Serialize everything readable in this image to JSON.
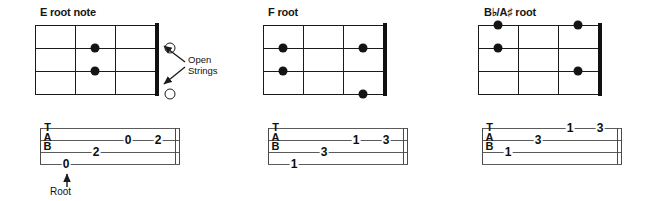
{
  "figure": {
    "kind": "guitar-chord-and-tab-figure",
    "panel_count": 3
  },
  "annotations": {
    "open_strings_label_line1": "Open",
    "open_strings_label_line2": "Strings",
    "root_label": "Root"
  },
  "tab_clef_letters": {
    "t": "T",
    "a": "A",
    "b": "B"
  },
  "panels": [
    {
      "title": "E root note",
      "diagram": {
        "strings": 4,
        "frets": 3,
        "nut_side": "right",
        "dots": [
          {
            "string": 2,
            "fret": 2
          },
          {
            "string": 3,
            "fret": 2
          }
        ],
        "open_strings": [
          {
            "string": 2
          },
          {
            "string": 4
          }
        ]
      },
      "tab": {
        "lines": 4,
        "notes": [
          {
            "string": 4,
            "fret": "0",
            "pos": 1
          },
          {
            "string": 3,
            "fret": "2",
            "pos": 2
          },
          {
            "string": 2,
            "fret": "0",
            "pos": 3
          },
          {
            "string": 2,
            "fret": "2",
            "pos": 4
          }
        ],
        "root_note_index": 0
      }
    },
    {
      "title": "F root",
      "diagram": {
        "strings": 4,
        "frets": 3,
        "nut_side": "right",
        "dots": [
          {
            "string": 2,
            "fret": 1
          },
          {
            "string": 3,
            "fret": 1
          },
          {
            "string": 2,
            "fret": 3
          },
          {
            "string": 4,
            "fret": 3
          }
        ],
        "open_strings": []
      },
      "tab": {
        "lines": 4,
        "notes": [
          {
            "string": 4,
            "fret": "1",
            "pos": 1
          },
          {
            "string": 3,
            "fret": "3",
            "pos": 2
          },
          {
            "string": 2,
            "fret": "1",
            "pos": 3
          },
          {
            "string": 2,
            "fret": "3",
            "pos": 4
          }
        ],
        "root_note_index": null
      }
    },
    {
      "title": "B♭/A♯ root",
      "diagram": {
        "strings": 4,
        "frets": 3,
        "nut_side": "right",
        "dots": [
          {
            "string": 1,
            "fret": 1
          },
          {
            "string": 2,
            "fret": 1
          },
          {
            "string": 1,
            "fret": 3
          },
          {
            "string": 3,
            "fret": 3
          }
        ],
        "open_strings": []
      },
      "tab": {
        "lines": 4,
        "notes": [
          {
            "string": 3,
            "fret": "1",
            "pos": 1
          },
          {
            "string": 2,
            "fret": "3",
            "pos": 2
          },
          {
            "string": 1,
            "fret": "1",
            "pos": 3
          },
          {
            "string": 1,
            "fret": "3",
            "pos": 4
          }
        ],
        "root_note_index": null
      }
    }
  ],
  "colors": {
    "ink": "#141414",
    "staff": "#5b5b5b",
    "background": "#ffffff"
  }
}
